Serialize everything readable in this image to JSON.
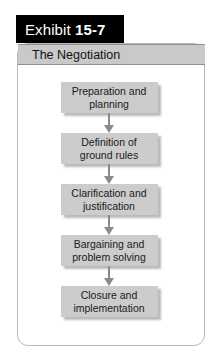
{
  "exhibit": {
    "label": "Exhibit ",
    "number": "15-7",
    "subtitle": "The Negotiation"
  },
  "colors": {
    "tab_background": "#000000",
    "tab_text": "#ffffff",
    "subtitle_background": "#c9c9c9",
    "step_background": "#cccccc",
    "arrow": "#8a8a8a",
    "panel_border": "#b9b9b9",
    "page_background": "#ffffff"
  },
  "chart_data": {
    "type": "diagram",
    "diagram_kind": "linear-process-flowchart",
    "title": "The Negotiation",
    "orientation": "vertical-top-to-bottom",
    "connector": "downward-arrow",
    "steps": [
      {
        "order": 1,
        "label": "Preparation and\nplanning"
      },
      {
        "order": 2,
        "label": "Definition of\nground rules"
      },
      {
        "order": 3,
        "label": "Clarification and\njustification"
      },
      {
        "order": 4,
        "label": "Bargaining and\nproblem solving"
      },
      {
        "order": 5,
        "label": "Closure and\nimplementation"
      }
    ]
  }
}
